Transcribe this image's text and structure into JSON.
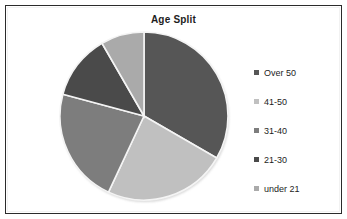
{
  "chart_data": {
    "type": "pie",
    "title": "Age Split",
    "xlabel": "",
    "ylabel": "",
    "legend_position": "right",
    "grid": false,
    "categories": [
      "Over 50",
      "41-50",
      "31-40",
      "21-30",
      "under 21"
    ],
    "values": [
      33,
      24,
      22,
      13,
      8
    ],
    "units": "percent",
    "start_angle_deg": 0,
    "direction": "clockwise",
    "slices": [
      {
        "label": "Over 50",
        "value": 33,
        "angle_deg": 120,
        "color": "#565656"
      },
      {
        "label": "41-50",
        "value": 24,
        "angle_deg": 85,
        "color": "#c0c0c0"
      },
      {
        "label": "31-40",
        "value": 22,
        "angle_deg": 80,
        "color": "#7d7d7d"
      },
      {
        "label": "21-30",
        "value": 13,
        "angle_deg": 45,
        "color": "#4a4a4a"
      },
      {
        "label": "under 21",
        "value": 8,
        "angle_deg": 30,
        "color": "#aaaaaa"
      }
    ]
  },
  "chart": {
    "title": "Age Split",
    "frame_border_color": "#2b2b2b",
    "background_color": "#ffffff",
    "slice_outline_color": "#f4f4f4"
  },
  "legend": {
    "items": [
      {
        "label": "Over 50",
        "color": "#565656",
        "marker": "square-marker"
      },
      {
        "label": "41-50",
        "color": "#c0c0c0",
        "marker": "square-marker"
      },
      {
        "label": "31-40",
        "color": "#7d7d7d",
        "marker": "square-marker"
      },
      {
        "label": "21-30",
        "color": "#4a4a4a",
        "marker": "square-marker"
      },
      {
        "label": "under 21",
        "color": "#aaaaaa",
        "marker": "square-marker"
      }
    ]
  }
}
